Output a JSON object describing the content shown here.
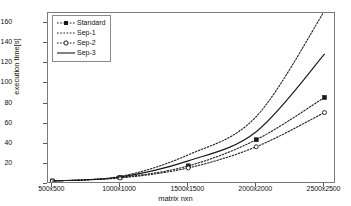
{
  "chart_data": {
    "type": "line",
    "title": "",
    "xlabel": "matrix nxn",
    "ylabel": "execution time[s]",
    "categories": [
      "500x500",
      "1000x1000",
      "1500x1500",
      "2000x2000",
      "2500x2500"
    ],
    "ylim": [
      0,
      170
    ],
    "yticks": [
      0,
      20,
      40,
      60,
      80,
      100,
      120,
      140,
      160
    ],
    "ytick_labels": [
      "0",
      "20",
      "40",
      "60",
      "80",
      "100",
      "120",
      "140",
      "160"
    ],
    "grid": false,
    "legend_position": "upper left",
    "series": [
      {
        "name": "Standard",
        "style": "dotted",
        "marker": "filled-square",
        "color": "#1a1a1a",
        "values": [
          3,
          6.5,
          18,
          44,
          86
        ]
      },
      {
        "name": "Sep-1",
        "style": "dotted",
        "marker": "none",
        "color": "#1a1a1a",
        "values": [
          3,
          7.5,
          29,
          67,
          172
        ]
      },
      {
        "name": "Sep-2",
        "style": "dotted",
        "marker": "open-circle",
        "color": "#1a1a1a",
        "values": [
          3,
          6,
          16,
          37,
          71
        ]
      },
      {
        "name": "Sep-3",
        "style": "solid",
        "marker": "none",
        "color": "#1a1a1a",
        "values": [
          3,
          7,
          23,
          52,
          129
        ]
      }
    ]
  },
  "legend": {
    "items": [
      {
        "label": "Standard"
      },
      {
        "label": "Sep-1"
      },
      {
        "label": "Sep-2"
      },
      {
        "label": "Sep-3"
      }
    ]
  }
}
